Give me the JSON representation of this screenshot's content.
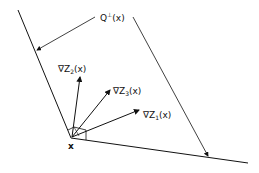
{
  "diagram": {
    "title_label": {
      "base": "Q",
      "sup": "⊥",
      "arg": "(x)"
    },
    "point_label": "x",
    "vectors": [
      {
        "name": "grad-z2",
        "prefix": "∇Z",
        "sub": "2",
        "arg": "(x)"
      },
      {
        "name": "grad-z3",
        "prefix": "∇Z",
        "sub": "3",
        "arg": "(x)"
      },
      {
        "name": "grad-z1",
        "prefix": "∇Z",
        "sub": "1",
        "arg": "(x)"
      }
    ],
    "colors": {
      "line": "#111111",
      "background": "#ffffff"
    }
  }
}
